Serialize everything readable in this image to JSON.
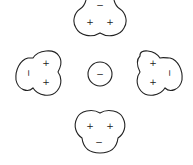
{
  "diagram": {
    "center_ion": {
      "charge_label": "−"
    },
    "molecules": [
      {
        "position": "top",
        "oxygen_label": "−",
        "hydrogen_labels": [
          "+",
          "+"
        ]
      },
      {
        "position": "left",
        "oxygen_label": "−",
        "hydrogen_labels": [
          "+",
          "+"
        ]
      },
      {
        "position": "right",
        "oxygen_label": "−",
        "hydrogen_labels": [
          "+",
          "+"
        ]
      },
      {
        "position": "bottom",
        "oxygen_label": "−",
        "hydrogen_labels": [
          "+",
          "+"
        ]
      }
    ],
    "colors": {
      "stroke": "#222222",
      "background": "#ffffff"
    }
  }
}
